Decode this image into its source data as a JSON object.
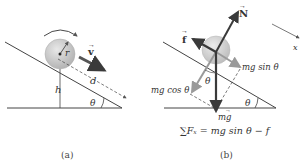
{
  "figure": {
    "panels": [
      {
        "id": "a",
        "caption": "(a)",
        "labels": {
          "radius": "r",
          "velocity": "v",
          "distance": "d",
          "height": "h",
          "angle": "θ"
        }
      },
      {
        "id": "b",
        "caption": "(b)",
        "labels": {
          "normal": "N",
          "friction": "f",
          "parallel": "mg sin θ",
          "perpendicular": "mg cos θ",
          "weight": "mg",
          "angle_incline": "θ",
          "angle_force": "θ",
          "axis": "x",
          "equation": "∑Fₓ = mg sin θ − f"
        }
      }
    ],
    "colors": {
      "line": "#444444",
      "ball": "#c8c8c8",
      "arrow_dark": "#3a3a3a",
      "arrow_light": "#9a9a9a"
    }
  }
}
